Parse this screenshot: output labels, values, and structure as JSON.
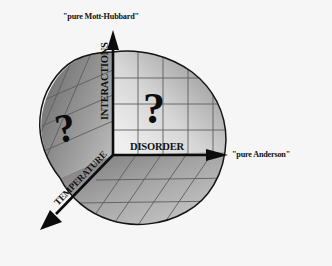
{
  "figure": {
    "title_visible": false,
    "background_color": "#f6f6f6",
    "type": "conceptual-3d-phase-diagram",
    "axes": [
      {
        "id": "interactions",
        "label": "INTERACTIONS",
        "orientation": "vertical-up",
        "endpoint_label": "\"pure Mott-Hubbard\"",
        "arrow": true
      },
      {
        "id": "disorder",
        "label": "DISORDER",
        "orientation": "horizontal-right",
        "endpoint_label": "\"pure Anderson\"",
        "arrow": true
      },
      {
        "id": "temperature",
        "label": "TEMPERATURE",
        "orientation": "diagonal-down-left",
        "endpoint_label": "",
        "arrow": true
      }
    ],
    "annotations": [
      {
        "id": "question-right",
        "text": "?",
        "face": "disorder-interactions",
        "has_dot": true
      },
      {
        "id": "question-left",
        "text": "?",
        "face": "temperature-interactions",
        "has_dot": true
      }
    ],
    "colors": {
      "background": "#f6f6f6",
      "axis": "#111111",
      "text": "#111111",
      "face_left_dark": "#6f6f6f",
      "face_left_light": "#b8b8b8",
      "face_right_dark": "#9a9a9a",
      "face_right_light": "#e4e4e4",
      "face_bottom_dark": "#7d7d7d",
      "face_bottom_light": "#c8c8c8",
      "grid": "#5a5a5a",
      "outline": "#1a1a1a"
    }
  },
  "labels": {
    "mott_hubbard": "\"pure Mott-Hubbard\"",
    "anderson": "\"pure Anderson\"",
    "interactions": "INTERACTIONS",
    "disorder": "DISORDER",
    "temperature": "TEMPERATURE",
    "question_right": "?",
    "question_left": "?"
  }
}
